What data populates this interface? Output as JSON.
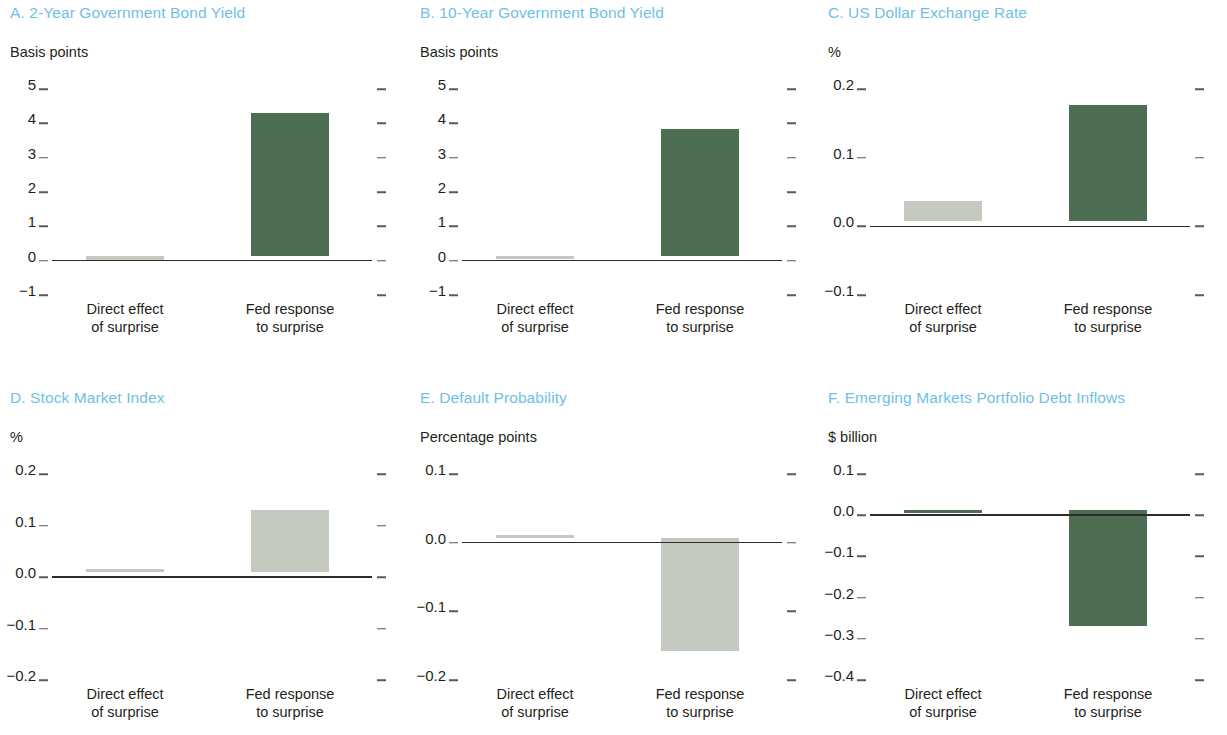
{
  "figure": {
    "title_color": "#6ec1e4",
    "bar_colors": {
      "green": "#4c6d51",
      "gray": "#c4cac0"
    },
    "axis_color": "#2c2c2c"
  },
  "categories": [
    "Direct effect of surprise",
    "Fed response to surprise"
  ],
  "category_lines": {
    "cat1_line1": "Direct effect",
    "cat1_line2": "of surprise",
    "cat2_line1": "Fed response",
    "cat2_line2": "to surprise"
  },
  "chart_data": [
    {
      "id": "A",
      "type": "bar",
      "title": "A. 2-Year Government Bond Yield",
      "ylabel": "Basis points",
      "xlabel": "",
      "categories": [
        "Direct effect of surprise",
        "Fed response to surprise"
      ],
      "values": [
        -0.15,
        4.15
      ],
      "colors": [
        "#c4cac0",
        "#4c6d51"
      ],
      "yticks": [
        5,
        4,
        3,
        2,
        1,
        0,
        -1
      ],
      "ytick_labels": [
        "5",
        "4",
        "3",
        "2",
        "1",
        "0",
        "−1"
      ],
      "ylim": [
        -1,
        5
      ],
      "grid": false,
      "legend": "none"
    },
    {
      "id": "B",
      "type": "bar",
      "title": "B. 10-Year Government Bond Yield",
      "ylabel": "Basis points",
      "xlabel": "",
      "categories": [
        "Direct effect of surprise",
        "Fed response to surprise"
      ],
      "values": [
        -0.07,
        3.7
      ],
      "colors": [
        "#c4cac0",
        "#4c6d51"
      ],
      "yticks": [
        5,
        4,
        3,
        2,
        1,
        0,
        -1
      ],
      "ytick_labels": [
        "5",
        "4",
        "3",
        "2",
        "1",
        "0",
        "−1"
      ],
      "ylim": [
        -1,
        5
      ],
      "grid": false,
      "legend": "none"
    },
    {
      "id": "C",
      "type": "bar",
      "title": "C. US Dollar Exchange Rate",
      "ylabel": "%",
      "xlabel": "",
      "categories": [
        "Direct effect of surprise",
        "Fed response to surprise"
      ],
      "values": [
        0.03,
        0.17
      ],
      "colors": [
        "#c4cac0",
        "#4c6d51"
      ],
      "yticks": [
        0.2,
        0.1,
        0.0,
        -0.1
      ],
      "ytick_labels": [
        "0.2",
        "0.1",
        "0.0",
        "−0.1"
      ],
      "ylim": [
        -0.1,
        0.2
      ],
      "grid": false,
      "legend": "none"
    },
    {
      "id": "D",
      "type": "bar",
      "title": "D. Stock Market Index",
      "ylabel": "%",
      "xlabel": "",
      "categories": [
        "Direct effect of surprise",
        "Fed response to surprise"
      ],
      "values": [
        0.005,
        0.12
      ],
      "colors": [
        "#c4cac0",
        "#c4cac0"
      ],
      "yticks": [
        0.2,
        0.1,
        0.0,
        -0.1,
        -0.2
      ],
      "ytick_labels": [
        "0.2",
        "0.1",
        "0.0",
        "−0.1",
        "−0.2"
      ],
      "ylim": [
        -0.2,
        0.2
      ],
      "grid": false,
      "legend": "none"
    },
    {
      "id": "E",
      "type": "bar",
      "title": "E. Default Probability",
      "ylabel": "Percentage points",
      "xlabel": "",
      "categories": [
        "Direct effect of surprise",
        "Fed response to surprise"
      ],
      "values": [
        0.004,
        -0.165
      ],
      "colors": [
        "#c4cac0",
        "#c4cac0"
      ],
      "yticks": [
        0.1,
        0.0,
        -0.1,
        -0.2
      ],
      "ytick_labels": [
        "0.1",
        "0.0",
        "−0.1",
        "−0.2"
      ],
      "ylim": [
        -0.2,
        0.1
      ],
      "grid": false,
      "legend": "none"
    },
    {
      "id": "F",
      "type": "bar",
      "title": "F. Emerging Markets Portfolio Debt Inflows",
      "ylabel": "$ billion",
      "xlabel": "",
      "categories": [
        "Direct effect of surprise",
        "Fed response to surprise"
      ],
      "values": [
        -0.004,
        -0.28
      ],
      "colors": [
        "#4c6d51",
        "#4c6d51"
      ],
      "yticks": [
        0.1,
        0.0,
        -0.1,
        -0.2,
        -0.3,
        -0.4
      ],
      "ytick_labels": [
        "0.1",
        "0.0",
        "−0.1",
        "−0.2",
        "−0.3",
        "−0.4"
      ],
      "ylim": [
        -0.4,
        0.1
      ],
      "grid": false,
      "legend": "none"
    }
  ]
}
